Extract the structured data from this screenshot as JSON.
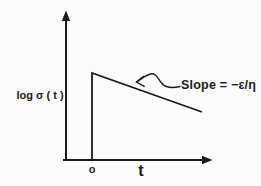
{
  "figure": {
    "background_color": "#fbfbfb",
    "ink_color": "#1b1b1b",
    "labels": {
      "y_axis": "log σ ( t )",
      "x_axis": "t",
      "origin": "o",
      "slope_annotation": "Slope = −ε/η"
    },
    "paths": {
      "y_axis": "66,160 66,16",
      "x_axis": "63,160 204,160",
      "y_axis_arrowhead": "M66,10.5 L61.8,21 L70.2,21 Z",
      "x_axis_arrowhead": "M212.5,160 L202,155.8 L202,164.2 Z",
      "stress_curve": "92,160 92,73 202,112",
      "annotation_arrow_curve": "M180,86.5 C172,88.5 166,88 162,83.5 C158,79 156,72.5 150.5,74 C146.5,75.2 141.5,78.5 137.5,81.5",
      "annotation_arrowhead": "M143.8,76.2 L136.2,82 L144.2,86.4"
    }
  },
  "chart_data": {
    "type": "line",
    "title": "",
    "xlabel": "t",
    "ylabel": "log σ ( t )",
    "x_tick_labels": [
      "o"
    ],
    "y_tick_labels": [],
    "grid": false,
    "axis_arrows": true,
    "series": [
      {
        "name": "log σ(t)",
        "shape": "vertical jump at t = o to a peak, then straight-line decay",
        "points_px": [
          [
            92,
            160
          ],
          [
            92,
            73
          ],
          [
            202,
            112
          ]
        ]
      }
    ],
    "annotations": [
      {
        "text": "Slope = −ε/η",
        "target": "decaying straight segment"
      }
    ]
  }
}
